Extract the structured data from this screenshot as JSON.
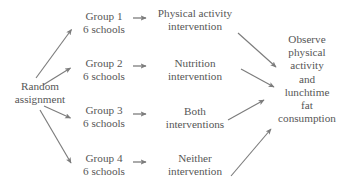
{
  "diagram": {
    "text_color": "#565656",
    "arrow_color": "#7c7c7c",
    "background": "#ffffff",
    "start": {
      "label_line1": "Random",
      "label_line2": "assignment"
    },
    "groups": [
      {
        "name": "Group 1",
        "size": "6 schools"
      },
      {
        "name": "Group 2",
        "size": "6 schools"
      },
      {
        "name": "Group 3",
        "size": "6 schools"
      },
      {
        "name": "Group 4",
        "size": "6 schools"
      }
    ],
    "treatments": [
      {
        "line1": "Physical activity",
        "line2": "intervention"
      },
      {
        "line1": "Nutrition",
        "line2": "intervention"
      },
      {
        "line1": "Both",
        "line2": "interventions"
      },
      {
        "line1": "Neither",
        "line2": "intervention"
      }
    ],
    "outcome": {
      "line1": "Observe",
      "line2": "physical",
      "line3": "activity",
      "line4": "and",
      "line5": "lunchtime",
      "line6": "fat",
      "line7": "consumption"
    }
  }
}
